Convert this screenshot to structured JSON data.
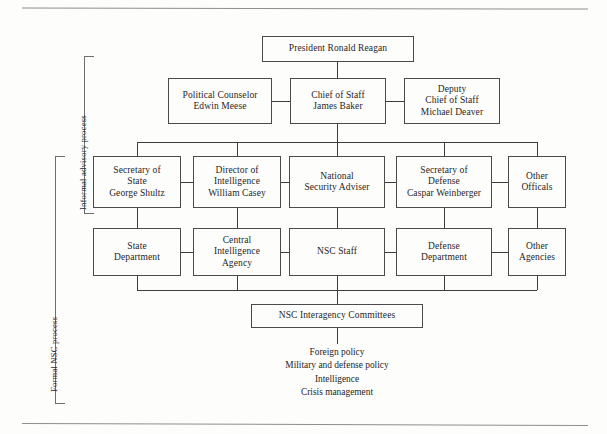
{
  "diagram": {
    "brackets": [
      {
        "label": "Informal advisory process"
      },
      {
        "label": "Formal NSC process"
      }
    ],
    "nodes": {
      "president": "President Ronald Reagan",
      "political_counselor": "Political Counselor\nEdwin Meese",
      "chief_of_staff": "Chief of Staff\nJames Baker",
      "deputy_chief_of_staff": "Deputy\nChief of Staff\nMichael Deaver",
      "secretary_of_state": "Secretary of\nState\nGeorge Shultz",
      "director_of_intelligence": "Director of\nIntelligence\nWilliam Casey",
      "national_security_adviser": "National\nSecurity Adviser",
      "secretary_of_defense": "Secretary of\nDefense\nCaspar Weinberger",
      "other_officials": "Other\nOfficals",
      "state_department": "State\nDepartment",
      "central_intelligence_agency": "Central\nIntelligence\nAgency",
      "nsc_staff": "NSC Staff",
      "defense_department": "Defense\nDepartment",
      "other_agencies": "Other\nAgencies",
      "nsc_interagency_committees": "NSC Interagency Committees"
    },
    "committee_topics": [
      "Foreign policy",
      "Military and defense policy",
      "Intelligence",
      "Crisis management"
    ],
    "colors": {
      "background": "#fdfdfb",
      "box_border": "#4a4a4a",
      "connector": "#3d3d3d",
      "bracket": "#6e6e6e",
      "text": "#1f1f1f",
      "page_rule": "#8d8d8d"
    }
  }
}
